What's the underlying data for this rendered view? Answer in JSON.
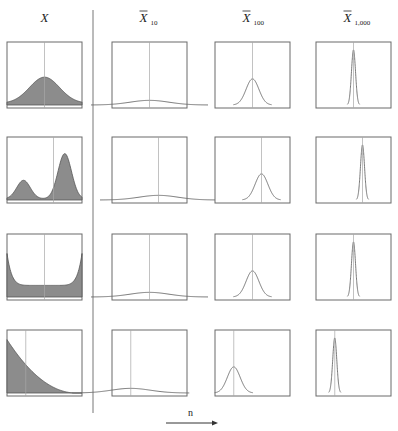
{
  "columns": [
    {
      "id": "x",
      "label": "X",
      "bar": false,
      "subscript": ""
    },
    {
      "id": "xbar10",
      "label": "X",
      "bar": true,
      "subscript": "10",
      "n": 10
    },
    {
      "id": "xbar100",
      "label": "X",
      "bar": true,
      "subscript": "100",
      "n": 100
    },
    {
      "id": "xbar1000",
      "label": "X",
      "bar": true,
      "subscript": "1,000",
      "n": 1000
    }
  ],
  "rows": [
    {
      "id": "normal",
      "population_shape": "unimodal symmetric (bell)",
      "mean_frac": 0.5
    },
    {
      "id": "bimodal",
      "population_shape": "bimodal, right mode taller",
      "mean_frac": 0.62
    },
    {
      "id": "u_shaped",
      "population_shape": "U-shaped symmetric",
      "mean_frac": 0.5
    },
    {
      "id": "right_skewed",
      "population_shape": "right-skewed decreasing",
      "mean_frac": 0.25
    }
  ],
  "axis_label": "n",
  "chart_data": {
    "type": "diagram",
    "title": "",
    "column_headers": [
      "X",
      "X̄10",
      "X̄100",
      "X̄1,000"
    ],
    "row_population_shapes": [
      "unimodal symmetric",
      "bimodal",
      "U-shaped",
      "right-skewed"
    ],
    "sample_sizes": [
      10,
      100,
      1000
    ],
    "mean_position_fraction": [
      0.5,
      0.62,
      0.5,
      0.25
    ],
    "relative_peak_height_of_sample_mean_curves": [
      0.08,
      0.45,
      0.95
    ],
    "arrow_label": "n",
    "arrow_direction": "right"
  }
}
